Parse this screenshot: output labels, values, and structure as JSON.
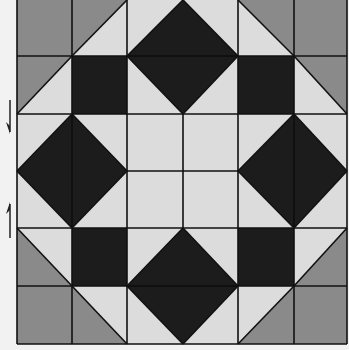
{
  "quilt": {
    "colors": {
      "background": "#f2f2f2",
      "light": "#dcdcdc",
      "gray": "#8a8a8a",
      "dark": "#1c1c1c",
      "line": "#111111"
    },
    "grid": {
      "cols": [
        17,
        72,
        127,
        183,
        238,
        294,
        347
      ],
      "rows": [
        0,
        56,
        114,
        171,
        228,
        286,
        344
      ]
    },
    "pattern_description": "6x6 quilt block: gray corner squares, half-square gray/light triangles, dark squares, four dark diamonds around a light center square"
  },
  "annotations": {
    "left_arrows": [
      {
        "direction": "down",
        "icon": "arrow-down-icon"
      },
      {
        "direction": "up",
        "icon": "arrow-up-icon"
      }
    ]
  }
}
